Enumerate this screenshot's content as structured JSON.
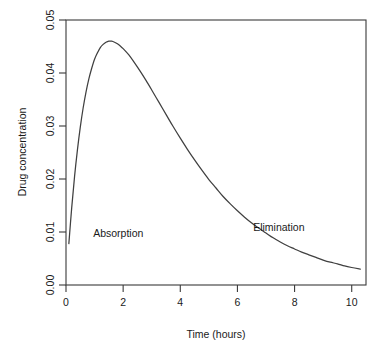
{
  "chart_data": {
    "type": "line",
    "title": "",
    "xlabel": "Time (hours)",
    "ylabel": "Drug concentration",
    "xlim": [
      0,
      10.5
    ],
    "ylim": [
      0,
      0.05
    ],
    "grid": false,
    "legend": null,
    "xticks": [
      0,
      2,
      4,
      6,
      8,
      10
    ],
    "xticklabels": [
      "0",
      "2",
      "4",
      "6",
      "8",
      "10"
    ],
    "yticks": [
      0.0,
      0.01,
      0.02,
      0.03,
      0.04,
      0.05
    ],
    "yticklabels": [
      "0.00",
      "0.01",
      "0.02",
      "0.03",
      "0.04",
      "0.05"
    ],
    "series": [
      {
        "name": "Drug concentration",
        "color": "#404040",
        "x": [
          0.1,
          0.2,
          0.3,
          0.4,
          0.5,
          0.6,
          0.7,
          0.8,
          0.9,
          1.0,
          1.1,
          1.2,
          1.3,
          1.4,
          1.5,
          1.6,
          1.7,
          1.8,
          1.9,
          2.0,
          2.2,
          2.4,
          2.6,
          2.8,
          3.0,
          3.25,
          3.5,
          3.75,
          4.0,
          4.25,
          4.5,
          4.75,
          5.0,
          5.25,
          5.5,
          5.75,
          6.0,
          6.25,
          6.5,
          6.75,
          7.0,
          7.25,
          7.5,
          7.75,
          8.0,
          8.25,
          8.5,
          8.75,
          9.0,
          9.25,
          9.5,
          9.75,
          10.0,
          10.3
        ],
        "y": [
          0.0078,
          0.0146,
          0.0205,
          0.0255,
          0.0298,
          0.0334,
          0.0364,
          0.0389,
          0.0409,
          0.0426,
          0.0438,
          0.0448,
          0.0454,
          0.0458,
          0.046,
          0.046,
          0.0458,
          0.0455,
          0.0451,
          0.0446,
          0.0434,
          0.0419,
          0.0403,
          0.0386,
          0.0368,
          0.0345,
          0.0322,
          0.0299,
          0.0277,
          0.0256,
          0.0236,
          0.0217,
          0.0199,
          0.0183,
          0.0167,
          0.0153,
          0.014,
          0.0128,
          0.0117,
          0.0107,
          0.0098,
          0.0089,
          0.0081,
          0.0074,
          0.0068,
          0.0062,
          0.0057,
          0.0052,
          0.0047,
          0.0043,
          0.004,
          0.0036,
          0.0033,
          0.003
        ]
      }
    ],
    "annotations": [
      {
        "text": "Absorption",
        "x": 0.95,
        "y": 0.009
      },
      {
        "text": "Elimination",
        "x": 6.55,
        "y": 0.0102
      }
    ]
  }
}
